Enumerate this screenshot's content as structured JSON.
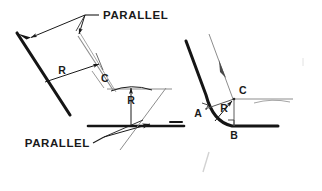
{
  "figure": {
    "title_visible": false,
    "background_color": "#ffffff",
    "ink_color": "#1a1a1a",
    "construction_color": "#8a8a8a",
    "faint_color": "#cfcfcf"
  },
  "left_figure": {
    "labels": {
      "parallel_top": "PARALLEL",
      "parallel_bottom": "PARALLEL",
      "radius_left": "R",
      "radius_mid": "R",
      "point_c": "C"
    }
  },
  "right_figure": {
    "labels": {
      "point_a": "A",
      "point_b": "B",
      "point_c": "C",
      "radius": "R"
    }
  }
}
